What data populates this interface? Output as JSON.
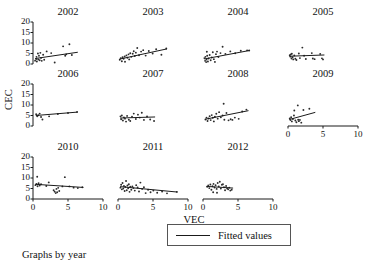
{
  "chart_data": {
    "type": "scatter",
    "title": "",
    "subtitle": "",
    "caption": "Graphs by year",
    "xlabel": "VEC",
    "ylabel": "CEC",
    "xlim": [
      0,
      10
    ],
    "ylim": [
      0,
      20
    ],
    "xticks": [
      "0",
      "5",
      "10"
    ],
    "xtick_values": [
      0,
      5,
      10
    ],
    "yticks": [
      "0",
      "5",
      "10",
      "15",
      "20"
    ],
    "ytick_values": [
      0,
      5,
      10,
      15,
      20
    ],
    "grid": false,
    "legend": {
      "position": "bottom-center",
      "entries": [
        {
          "label": "Fitted values",
          "marker": "line",
          "color": "#1a1a1a"
        }
      ]
    },
    "facet_by": "year",
    "facet_layout": {
      "rows": 3,
      "cols": 4
    },
    "panels": [
      {
        "title": "2002",
        "row": 0,
        "col": 0,
        "fit": {
          "x0": 0.3,
          "y0": 2.6,
          "x1": 6.4,
          "y1": 5.6
        },
        "points": [
          [
            0.3,
            1.6
          ],
          [
            0.45,
            2.4
          ],
          [
            0.5,
            3.4
          ],
          [
            0.55,
            1.2
          ],
          [
            0.7,
            5.0
          ],
          [
            0.75,
            2.2
          ],
          [
            0.85,
            3.9
          ],
          [
            0.95,
            1.8
          ],
          [
            1.05,
            5.3
          ],
          [
            1.15,
            2.9
          ],
          [
            1.25,
            1.5
          ],
          [
            1.45,
            4.4
          ],
          [
            1.6,
            2.0
          ],
          [
            1.95,
            6.0
          ],
          [
            2.6,
            5.2
          ],
          [
            3.1,
            0.7
          ],
          [
            4.3,
            8.4
          ],
          [
            4.6,
            3.9
          ],
          [
            4.75,
            4.6
          ],
          [
            5.2,
            9.4
          ],
          [
            5.55,
            4.3
          ]
        ]
      },
      {
        "title": "2003",
        "row": 0,
        "col": 1,
        "fit": {
          "x0": 0.2,
          "y0": 2.3,
          "x1": 7.0,
          "y1": 7.2
        },
        "points": [
          [
            0.25,
            2.0
          ],
          [
            0.4,
            2.8
          ],
          [
            0.55,
            1.3
          ],
          [
            0.65,
            3.2
          ],
          [
            0.8,
            2.5
          ],
          [
            0.95,
            3.6
          ],
          [
            1.0,
            1.1
          ],
          [
            1.2,
            4.1
          ],
          [
            1.35,
            3.0
          ],
          [
            1.5,
            4.6
          ],
          [
            1.6,
            2.2
          ],
          [
            1.75,
            5.1
          ],
          [
            1.9,
            3.4
          ],
          [
            2.1,
            4.9
          ],
          [
            2.25,
            6.1
          ],
          [
            2.4,
            3.8
          ],
          [
            2.55,
            5.4
          ],
          [
            2.75,
            7.6
          ],
          [
            3.0,
            4.2
          ],
          [
            3.3,
            5.9
          ],
          [
            3.6,
            6.6
          ],
          [
            3.95,
            4.0
          ],
          [
            4.4,
            6.2
          ],
          [
            4.95,
            5.0
          ],
          [
            5.45,
            7.0
          ],
          [
            6.2,
            4.4
          ],
          [
            6.9,
            7.4
          ]
        ]
      },
      {
        "title": "2004",
        "row": 0,
        "col": 2,
        "fit": {
          "x0": 0.2,
          "y0": 2.4,
          "x1": 6.6,
          "y1": 6.4
        },
        "points": [
          [
            0.2,
            2.8
          ],
          [
            0.3,
            1.5
          ],
          [
            0.35,
            3.4
          ],
          [
            0.45,
            0.9
          ],
          [
            0.5,
            2.1
          ],
          [
            0.6,
            3.9
          ],
          [
            0.7,
            1.2
          ],
          [
            0.8,
            2.6
          ],
          [
            0.95,
            4.3
          ],
          [
            1.1,
            1.8
          ],
          [
            1.25,
            3.1
          ],
          [
            1.4,
            5.6
          ],
          [
            1.55,
            2.3
          ],
          [
            1.7,
            1.0
          ],
          [
            1.85,
            4.7
          ],
          [
            2.0,
            5.9
          ],
          [
            2.2,
            3.3
          ],
          [
            2.5,
            5.2
          ],
          [
            2.8,
            8.2
          ],
          [
            3.2,
            4.8
          ],
          [
            3.9,
            6.0
          ],
          [
            4.6,
            5.1
          ],
          [
            5.4,
            6.3
          ],
          [
            6.3,
            6.5
          ],
          [
            6.6,
            6.4
          ],
          [
            0.55,
            5.8
          ]
        ]
      },
      {
        "title": "2005",
        "row": 0,
        "col": 3,
        "fit": {
          "x0": 0.2,
          "y0": 3.7,
          "x1": 5.2,
          "y1": 4.3
        },
        "points": [
          [
            0.25,
            4.2
          ],
          [
            0.35,
            3.5
          ],
          [
            0.4,
            4.6
          ],
          [
            0.5,
            2.6
          ],
          [
            0.55,
            4.9
          ],
          [
            0.65,
            3.2
          ],
          [
            0.75,
            2.2
          ],
          [
            0.9,
            4.1
          ],
          [
            1.05,
            2.5
          ],
          [
            1.2,
            1.9
          ],
          [
            1.55,
            5.0
          ],
          [
            1.7,
            2.8
          ],
          [
            2.05,
            7.8
          ],
          [
            2.3,
            3.9
          ],
          [
            2.55,
            2.4
          ],
          [
            3.4,
            5.2
          ],
          [
            3.55,
            2.6
          ],
          [
            3.8,
            2.3
          ],
          [
            4.6,
            4.8
          ],
          [
            4.85,
            2.7
          ],
          [
            5.0,
            2.2
          ]
        ]
      },
      {
        "title": "2006",
        "row": 1,
        "col": 0,
        "fit": {
          "x0": 0.4,
          "y0": 5.0,
          "x1": 6.3,
          "y1": 6.6
        },
        "points": [
          [
            0.45,
            5.6
          ],
          [
            0.6,
            4.6
          ],
          [
            0.75,
            5.1
          ],
          [
            0.95,
            5.9
          ],
          [
            1.15,
            4.3
          ],
          [
            1.35,
            3.1
          ],
          [
            2.3,
            4.6
          ],
          [
            3.55,
            5.7
          ],
          [
            5.0,
            6.2
          ],
          [
            6.3,
            6.7
          ]
        ]
      },
      {
        "title": "2007",
        "row": 1,
        "col": 1,
        "fit": {
          "x0": 0.3,
          "y0": 3.8,
          "x1": 5.3,
          "y1": 4.3
        },
        "points": [
          [
            0.35,
            4.6
          ],
          [
            0.45,
            3.2
          ],
          [
            0.55,
            5.0
          ],
          [
            0.7,
            2.6
          ],
          [
            0.85,
            4.1
          ],
          [
            1.0,
            3.5
          ],
          [
            1.15,
            2.1
          ],
          [
            1.3,
            4.8
          ],
          [
            1.55,
            3.0
          ],
          [
            1.75,
            2.4
          ],
          [
            2.0,
            4.4
          ],
          [
            2.25,
            5.9
          ],
          [
            2.55,
            3.3
          ],
          [
            2.85,
            5.4
          ],
          [
            3.1,
            4.0
          ],
          [
            3.4,
            6.3
          ],
          [
            3.7,
            2.9
          ],
          [
            4.15,
            4.5
          ],
          [
            4.6,
            3.1
          ],
          [
            5.15,
            2.4
          ]
        ]
      },
      {
        "title": "2008",
        "row": 1,
        "col": 2,
        "fit": {
          "x0": 0.3,
          "y0": 3.2,
          "x1": 6.5,
          "y1": 7.3
        },
        "points": [
          [
            0.35,
            3.1
          ],
          [
            0.5,
            4.0
          ],
          [
            0.65,
            2.4
          ],
          [
            0.8,
            3.6
          ],
          [
            0.95,
            4.7
          ],
          [
            1.1,
            2.8
          ],
          [
            1.25,
            5.2
          ],
          [
            1.4,
            3.9
          ],
          [
            1.55,
            2.2
          ],
          [
            1.7,
            4.4
          ],
          [
            1.9,
            5.8
          ],
          [
            2.1,
            3.5
          ],
          [
            2.3,
            6.6
          ],
          [
            2.55,
            4.2
          ],
          [
            2.8,
            5.0
          ],
          [
            3.05,
            3.0
          ],
          [
            3.35,
            6.2
          ],
          [
            3.65,
            2.7
          ],
          [
            3.95,
            3.2
          ],
          [
            4.2,
            2.9
          ],
          [
            4.55,
            4.0
          ],
          [
            5.1,
            3.4
          ],
          [
            5.6,
            6.9
          ],
          [
            6.2,
            7.8
          ],
          [
            2.95,
            10.6
          ]
        ]
      },
      {
        "title": "2009",
        "row": 1,
        "col": 3,
        "fit": {
          "x0": 0.2,
          "y0": 3.1,
          "x1": 3.9,
          "y1": 6.5
        },
        "points": [
          [
            0.25,
            3.6
          ],
          [
            0.35,
            2.8
          ],
          [
            0.45,
            4.2
          ],
          [
            0.55,
            2.2
          ],
          [
            0.7,
            3.3
          ],
          [
            0.85,
            5.0
          ],
          [
            1.05,
            2.6
          ],
          [
            1.2,
            1.8
          ],
          [
            1.45,
            3.0
          ],
          [
            1.55,
            2.3
          ],
          [
            1.7,
            2.9
          ],
          [
            1.9,
            1.6
          ],
          [
            0.9,
            7.4
          ],
          [
            1.4,
            9.8
          ],
          [
            2.2,
            7.6
          ],
          [
            3.05,
            8.2
          ]
        ]
      },
      {
        "title": "2010",
        "row": 2,
        "col": 0,
        "fit": {
          "x0": 0.3,
          "y0": 7.0,
          "x1": 7.2,
          "y1": 5.5
        },
        "points": [
          [
            0.35,
            6.6
          ],
          [
            0.5,
            7.2
          ],
          [
            0.65,
            6.1
          ],
          [
            0.8,
            7.5
          ],
          [
            0.95,
            6.4
          ],
          [
            1.15,
            7.0
          ],
          [
            0.6,
            10.6
          ],
          [
            1.9,
            6.2
          ],
          [
            2.25,
            7.9
          ],
          [
            2.95,
            4.2
          ],
          [
            3.1,
            3.5
          ],
          [
            3.25,
            2.8
          ],
          [
            3.35,
            4.8
          ],
          [
            3.45,
            3.2
          ],
          [
            3.6,
            5.3
          ],
          [
            3.75,
            3.8
          ],
          [
            4.2,
            6.0
          ],
          [
            4.55,
            10.4
          ],
          [
            5.2,
            6.0
          ],
          [
            5.8,
            5.4
          ],
          [
            6.4,
            5.2
          ],
          [
            7.05,
            5.6
          ]
        ]
      },
      {
        "title": "2011",
        "row": 2,
        "col": 1,
        "fit": {
          "x0": 0.3,
          "y0": 5.9,
          "x1": 8.5,
          "y1": 3.3
        },
        "points": [
          [
            0.35,
            5.4
          ],
          [
            0.45,
            6.8
          ],
          [
            0.55,
            4.6
          ],
          [
            0.65,
            7.6
          ],
          [
            0.75,
            5.0
          ],
          [
            0.85,
            6.2
          ],
          [
            0.95,
            3.8
          ],
          [
            1.05,
            5.7
          ],
          [
            1.15,
            8.6
          ],
          [
            1.25,
            4.2
          ],
          [
            1.35,
            6.4
          ],
          [
            1.45,
            5.1
          ],
          [
            1.55,
            7.0
          ],
          [
            1.65,
            3.4
          ],
          [
            1.75,
            5.8
          ],
          [
            1.9,
            4.4
          ],
          [
            2.05,
            6.0
          ],
          [
            2.2,
            5.2
          ],
          [
            2.4,
            4.0
          ],
          [
            2.6,
            6.6
          ],
          [
            2.8,
            5.5
          ],
          [
            3.0,
            3.6
          ],
          [
            3.2,
            7.8
          ],
          [
            3.45,
            4.8
          ],
          [
            3.7,
            5.6
          ],
          [
            3.95,
            2.8
          ],
          [
            4.3,
            4.4
          ],
          [
            4.65,
            3.2
          ],
          [
            5.05,
            4.0
          ],
          [
            5.6,
            3.0
          ],
          [
            6.3,
            3.6
          ],
          [
            7.0,
            2.7
          ],
          [
            8.4,
            3.4
          ]
        ]
      },
      {
        "title": "2012",
        "row": 2,
        "col": 2,
        "fit": {
          "x0": 0.5,
          "y0": 6.0,
          "x1": 4.3,
          "y1": 5.2
        },
        "points": [
          [
            0.6,
            5.8
          ],
          [
            0.75,
            6.4
          ],
          [
            0.9,
            5.2
          ],
          [
            1.05,
            6.9
          ],
          [
            1.2,
            4.4
          ],
          [
            1.35,
            6.1
          ],
          [
            1.5,
            7.2
          ],
          [
            1.65,
            5.5
          ],
          [
            1.8,
            6.6
          ],
          [
            1.95,
            4.8
          ],
          [
            2.1,
            7.6
          ],
          [
            2.25,
            6.0
          ],
          [
            2.4,
            8.2
          ],
          [
            2.55,
            5.0
          ],
          [
            2.7,
            6.8
          ],
          [
            2.85,
            7.0
          ],
          [
            3.0,
            5.6
          ],
          [
            3.15,
            4.2
          ],
          [
            3.3,
            6.2
          ],
          [
            3.45,
            5.0
          ],
          [
            3.6,
            4.6
          ],
          [
            3.75,
            5.4
          ],
          [
            3.9,
            4.0
          ],
          [
            4.1,
            4.4
          ],
          [
            1.45,
            3.2
          ],
          [
            2.0,
            3.0
          ]
        ]
      }
    ]
  },
  "labels": {
    "ylabel": "CEC",
    "xlabel": "VEC",
    "caption": "Graphs by year",
    "legend_label": "Fitted values",
    "ytick_0": "0",
    "ytick_5": "5",
    "ytick_10": "10",
    "ytick_15": "15",
    "ytick_20": "20",
    "xtick_0": "0",
    "xtick_5": "5",
    "xtick_10": "10"
  }
}
